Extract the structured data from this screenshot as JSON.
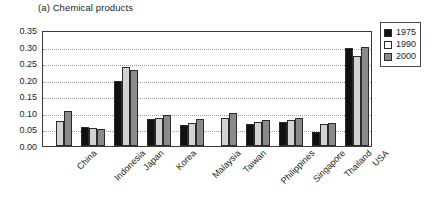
{
  "chart_data": {
    "type": "bar",
    "title": "(a) Chemical products",
    "xlabel": "",
    "ylabel": "",
    "ylim": [
      0.0,
      0.35
    ],
    "ytick_step": 0.05,
    "ytick_labels": [
      "0.35",
      "0.30",
      "0.25",
      "0.20",
      "0.15",
      "0.10",
      "0.05",
      "0.00"
    ],
    "ytick_values": [
      0.35,
      0.3,
      0.25,
      0.2,
      0.15,
      0.1,
      0.05,
      0.0
    ],
    "grid": true,
    "grid_style": "dotted-horizontal",
    "legend_position": "right-outside",
    "categories": [
      "China",
      "Indonesia",
      "Japan",
      "Korea",
      "Malaysia",
      "Taiwan",
      "Philippines",
      "Singapore",
      "Thailand",
      "USA"
    ],
    "series": [
      {
        "name": "1975",
        "color": "#111111",
        "values": [
          null,
          0.057,
          0.195,
          0.082,
          0.063,
          null,
          0.065,
          0.072,
          0.043,
          0.295
        ]
      },
      {
        "name": "1990",
        "color": "#d2d2d2",
        "values": [
          0.075,
          0.053,
          0.238,
          0.085,
          0.068,
          0.085,
          0.073,
          0.08,
          0.065,
          0.272
        ]
      },
      {
        "name": "2000",
        "color": "#8a8a8a",
        "values": [
          0.105,
          0.05,
          0.23,
          0.095,
          0.082,
          0.1,
          0.08,
          0.085,
          0.068,
          0.3
        ]
      }
    ]
  },
  "legend": {
    "items": [
      {
        "label": "1975",
        "color": "#111111"
      },
      {
        "label": "1990",
        "color": "#ffffff"
      },
      {
        "label": "2000",
        "color": "#8a8a8a"
      }
    ]
  }
}
